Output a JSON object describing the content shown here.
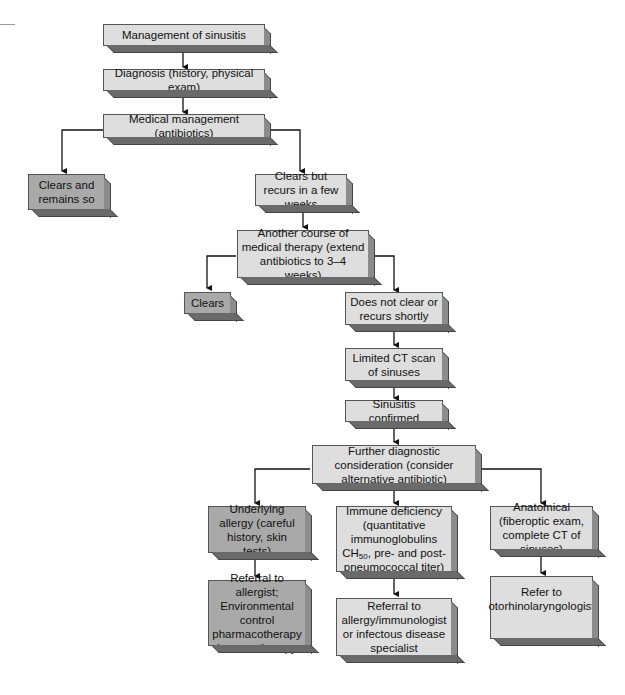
{
  "title": "Management of sinusitis",
  "nodes": {
    "root": "Management of sinusitis",
    "diagnosis": "Diagnosis (history, physical exam)",
    "medical": "Medical management (antibiotics)",
    "clears_remains": "Clears and remains so",
    "clears_recurs": "Clears but recurs in a few weeks",
    "another_course": "Another course of medical therapy (extend antibiotics to 3–4 weeks)",
    "clears": "Clears",
    "not_clear": "Does not clear or recurs shortly",
    "ct_scan": "Limited CT scan of sinuses",
    "confirmed": "Sinusitis confirmed",
    "further": "Further diagnostic consideration (consider alternative antibiotic)",
    "allergy": "Underlying allergy (careful history, skin tests)",
    "immune_pre": "Immune deficiency (quantitative immunoglobulins CH",
    "immune_sub": "50",
    "immune_post": ", pre- and post-pneumococcal titer)",
    "anatomical": "Anatomical (fiberoptic exam, complete CT of sinuses)",
    "ref_allergist": "Referral to allergist; Environmental control pharmacotherapy immunotherapy",
    "ref_immunologist": "Referral to allergy/immunologist or infectous disease specialist",
    "ref_ent": "Refer to otorhinolaryngologist"
  },
  "colors": {
    "light_box": "#dedede",
    "dark_box": "#a9a9a9",
    "line": "#111111"
  }
}
